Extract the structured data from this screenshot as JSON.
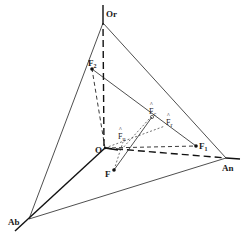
{
  "diagram": {
    "type": "tetrahedral-vector-diagram",
    "vertices": {
      "Or": {
        "label": "Or",
        "x": 103,
        "y": 23
      },
      "O": {
        "label": "O",
        "x": 105,
        "y": 148
      },
      "An": {
        "label": "An",
        "x": 226,
        "y": 158
      },
      "Ab": {
        "label": "Ab",
        "x": 29,
        "y": 219
      }
    },
    "points": {
      "F2": {
        "label": "F",
        "sub": "2",
        "hat": false,
        "x": 92,
        "y": 69
      },
      "F1": {
        "label": "F",
        "sub": "1",
        "hat": false,
        "x": 196,
        "y": 146
      },
      "Fc": {
        "label": "F",
        "sub": "c",
        "hat": true,
        "x": 152,
        "y": 117
      },
      "Fr": {
        "label": "F",
        "sub": "r",
        "hat": true,
        "x": 165,
        "y": 126
      },
      "Fu": {
        "label": "F",
        "sub": "u",
        "hat": true,
        "x": 123,
        "y": 142
      },
      "F": {
        "label": "F",
        "sub": "",
        "hat": false,
        "x": 114,
        "y": 170
      }
    },
    "colors": {
      "line": "#111111",
      "background": "#ffffff"
    }
  }
}
